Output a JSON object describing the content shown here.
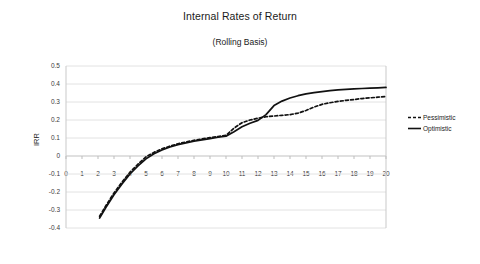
{
  "chart_data": {
    "type": "line",
    "title": "Internal Rates of Return",
    "subtitle": "(Rolling Basis)",
    "xlabel": "",
    "ylabel": "IRR",
    "xlim": [
      0,
      20
    ],
    "ylim": [
      -0.4,
      0.5
    ],
    "ytick_step": 0.1,
    "xtick_step": 1,
    "grid": true,
    "legend_position": "right",
    "x_ticks": [
      "0",
      "1",
      "2",
      "3",
      "4",
      "5",
      "6",
      "7",
      "8",
      "9",
      "10",
      "11",
      "12",
      "13",
      "14",
      "15",
      "16",
      "17",
      "18",
      "19",
      "20"
    ],
    "y_ticks": [
      "0.5",
      "0.4",
      "0.3",
      "0.2",
      "0.1",
      "0",
      "-0.1",
      "-0.2",
      "-0.3",
      "-0.4"
    ],
    "x": [
      2.1,
      2.5,
      3,
      3.5,
      4,
      4.5,
      5,
      5.5,
      6,
      6.5,
      7,
      7.5,
      8,
      8.5,
      9,
      9.5,
      10,
      10.5,
      11,
      11.5,
      12,
      12.5,
      13,
      13.5,
      14,
      14.5,
      15,
      15.5,
      16,
      16.5,
      17,
      17.5,
      18,
      18.5,
      19,
      19.5,
      20
    ],
    "series": [
      {
        "name": "Pessimistic",
        "style": "dashed",
        "color": "#111111",
        "values": [
          -0.335,
          -0.275,
          -0.205,
          -0.145,
          -0.09,
          -0.045,
          -0.005,
          0.02,
          0.04,
          0.055,
          0.068,
          0.078,
          0.087,
          0.095,
          0.102,
          0.108,
          0.115,
          0.155,
          0.185,
          0.2,
          0.21,
          0.218,
          0.222,
          0.226,
          0.23,
          0.238,
          0.253,
          0.272,
          0.287,
          0.296,
          0.303,
          0.309,
          0.314,
          0.319,
          0.323,
          0.327,
          0.331
        ]
      },
      {
        "name": "Optimistic",
        "style": "solid",
        "color": "#111111",
        "values": [
          -0.345,
          -0.285,
          -0.215,
          -0.155,
          -0.1,
          -0.055,
          -0.016,
          0.012,
          0.033,
          0.05,
          0.063,
          0.073,
          0.082,
          0.09,
          0.097,
          0.104,
          0.11,
          0.135,
          0.162,
          0.182,
          0.198,
          0.23,
          0.28,
          0.305,
          0.322,
          0.335,
          0.345,
          0.352,
          0.358,
          0.363,
          0.367,
          0.37,
          0.373,
          0.375,
          0.377,
          0.379,
          0.381
        ]
      }
    ]
  },
  "legend": {
    "items": [
      {
        "label": "Pessimistic",
        "style": "dashed"
      },
      {
        "label": "Optimistic",
        "style": "solid"
      }
    ]
  }
}
